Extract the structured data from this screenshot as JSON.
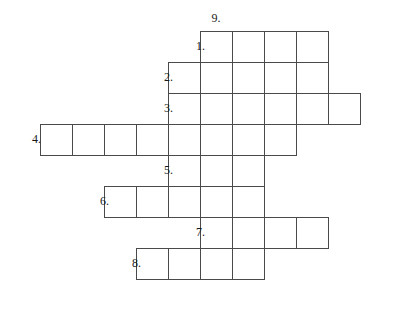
{
  "puzzle": {
    "type": "crossword-grid",
    "title": "",
    "cell_width": 32,
    "cell_height": 31,
    "origin_x": 40,
    "origin_y": 31,
    "grid_line_color": "#4a4a4a",
    "cell_fill_color": "#ffffff",
    "background_color": "#ffffff",
    "total_entries": 9,
    "across_entries": [
      {
        "number": "1.",
        "row": 0,
        "col_start": 5,
        "length": 4,
        "label_x": 196,
        "label_y": 46
      },
      {
        "number": "2.",
        "row": 1,
        "col_start": 4,
        "length": 5,
        "label_x": 164,
        "label_y": 77
      },
      {
        "number": "3.",
        "row": 2,
        "col_start": 4,
        "length": 6,
        "label_x": 164,
        "label_y": 108
      },
      {
        "number": "4.",
        "row": 3,
        "col_start": 0,
        "length": 8,
        "label_x": 32,
        "label_y": 139
      },
      {
        "number": "5.",
        "row": 4,
        "col_start": 4,
        "length": 3,
        "label_x": 164,
        "label_y": 170
      },
      {
        "number": "6.",
        "row": 5,
        "col_start": 2,
        "length": 5,
        "label_x": 100,
        "label_y": 201
      },
      {
        "number": "7.",
        "row": 6,
        "col_start": 5,
        "length": 4,
        "label_x": 196,
        "label_y": 232
      },
      {
        "number": "8.",
        "row": 7,
        "col_start": 3,
        "length": 4,
        "label_x": 132,
        "label_y": 263
      }
    ],
    "down_entries": [
      {
        "number": "9.",
        "col": 5,
        "row_start": 0,
        "length": 8,
        "label_x": 216,
        "label_y": 12
      }
    ],
    "cells": [
      {
        "row": 0,
        "col": 5
      },
      {
        "row": 0,
        "col": 6
      },
      {
        "row": 0,
        "col": 7
      },
      {
        "row": 0,
        "col": 8
      },
      {
        "row": 1,
        "col": 4
      },
      {
        "row": 1,
        "col": 5
      },
      {
        "row": 1,
        "col": 6
      },
      {
        "row": 1,
        "col": 7
      },
      {
        "row": 1,
        "col": 8
      },
      {
        "row": 2,
        "col": 4
      },
      {
        "row": 2,
        "col": 5
      },
      {
        "row": 2,
        "col": 6
      },
      {
        "row": 2,
        "col": 7
      },
      {
        "row": 2,
        "col": 8
      },
      {
        "row": 2,
        "col": 9
      },
      {
        "row": 3,
        "col": 0
      },
      {
        "row": 3,
        "col": 1
      },
      {
        "row": 3,
        "col": 2
      },
      {
        "row": 3,
        "col": 3
      },
      {
        "row": 3,
        "col": 4
      },
      {
        "row": 3,
        "col": 5
      },
      {
        "row": 3,
        "col": 6
      },
      {
        "row": 3,
        "col": 7
      },
      {
        "row": 4,
        "col": 4
      },
      {
        "row": 4,
        "col": 5
      },
      {
        "row": 4,
        "col": 6
      },
      {
        "row": 5,
        "col": 2
      },
      {
        "row": 5,
        "col": 3
      },
      {
        "row": 5,
        "col": 4
      },
      {
        "row": 5,
        "col": 5
      },
      {
        "row": 5,
        "col": 6
      },
      {
        "row": 6,
        "col": 5
      },
      {
        "row": 6,
        "col": 6
      },
      {
        "row": 6,
        "col": 7
      },
      {
        "row": 6,
        "col": 8
      },
      {
        "row": 7,
        "col": 3
      },
      {
        "row": 7,
        "col": 4
      },
      {
        "row": 7,
        "col": 5
      },
      {
        "row": 7,
        "col": 6
      }
    ]
  }
}
